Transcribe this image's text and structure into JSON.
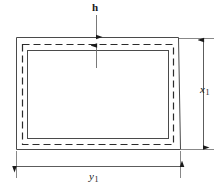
{
  "figure": {
    "kind": "engineering-dimension-diagram",
    "background_color": "#ffffff",
    "line_color": "#1a1a1a"
  },
  "shapes": {
    "outer_rectangle": {
      "name": "outer-profile",
      "style": "solid",
      "x": 16,
      "y": 37,
      "width": 163,
      "height": 113
    },
    "centerline_rectangle": {
      "name": "mid-centerline",
      "style": "dashed",
      "x": 22,
      "y": 44,
      "width": 151,
      "height": 100,
      "dash_pattern": "7 4"
    },
    "inner_rectangle": {
      "name": "inner-bore",
      "style": "solid",
      "x": 27,
      "y": 50,
      "width": 141,
      "height": 88
    }
  },
  "dimensions": [
    {
      "id": "h",
      "label": "h",
      "subscript": "",
      "meaning": "wall thickness",
      "orientation": "vertical",
      "position": "top"
    },
    {
      "id": "x1",
      "label": "x",
      "subscript": "1",
      "meaning": "outside height",
      "orientation": "vertical",
      "position": "right"
    },
    {
      "id": "y1",
      "label": "y",
      "subscript": "1",
      "meaning": "outside width",
      "orientation": "horizontal",
      "position": "bottom"
    }
  ]
}
